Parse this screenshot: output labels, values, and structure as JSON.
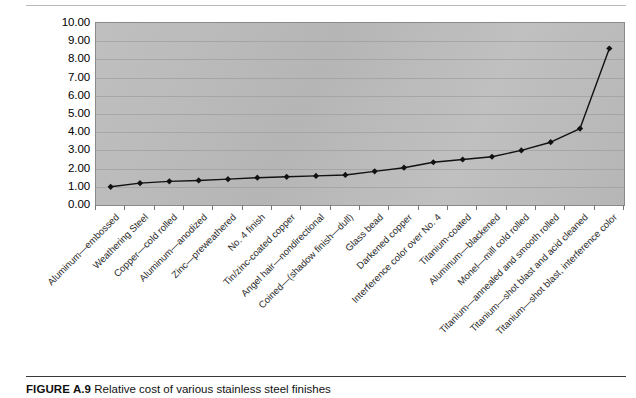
{
  "figure": {
    "id_label": "FIGURE A.9",
    "caption_text": "Relative cost of various stainless steel finishes"
  },
  "chart_data": {
    "type": "line",
    "title": "",
    "xlabel": "",
    "ylabel": "",
    "ylim": [
      0,
      10
    ],
    "ytick_step": 1,
    "grid": true,
    "legend": false,
    "plot_background": "#bcbcbc",
    "series_color": "#111111",
    "marker": "diamond",
    "ytick_labels": [
      "10.00",
      "9.00",
      "8.00",
      "7.00",
      "6.00",
      "5.00",
      "4.00",
      "3.00",
      "2.00",
      "1.00",
      "0.00"
    ],
    "categories": [
      "Aluminum—embossed",
      "Weathering Steel",
      "Copper—cold rolled",
      "Aluminum—anodized",
      "Zinc—preweathered",
      "No. 4 finish",
      "Tin/zinc-coated copper",
      "Angel hair—nondirectional",
      "Coined—(shadow finish—dull)",
      "Glass bead",
      "Darkened copper",
      "Interference color over No. 4",
      "Titanium-coated",
      "Aluminum—blackened",
      "Monel—mill cold rolled",
      "Titanium—annealed and smooth rolled",
      "Titanium—shot blast and acid cleaned",
      "Titanium—shot blast, interference color"
    ],
    "values": [
      1.0,
      1.2,
      1.3,
      1.35,
      1.42,
      1.5,
      1.55,
      1.6,
      1.65,
      1.85,
      2.05,
      2.35,
      2.5,
      2.65,
      3.0,
      3.45,
      4.2,
      8.6
    ]
  }
}
